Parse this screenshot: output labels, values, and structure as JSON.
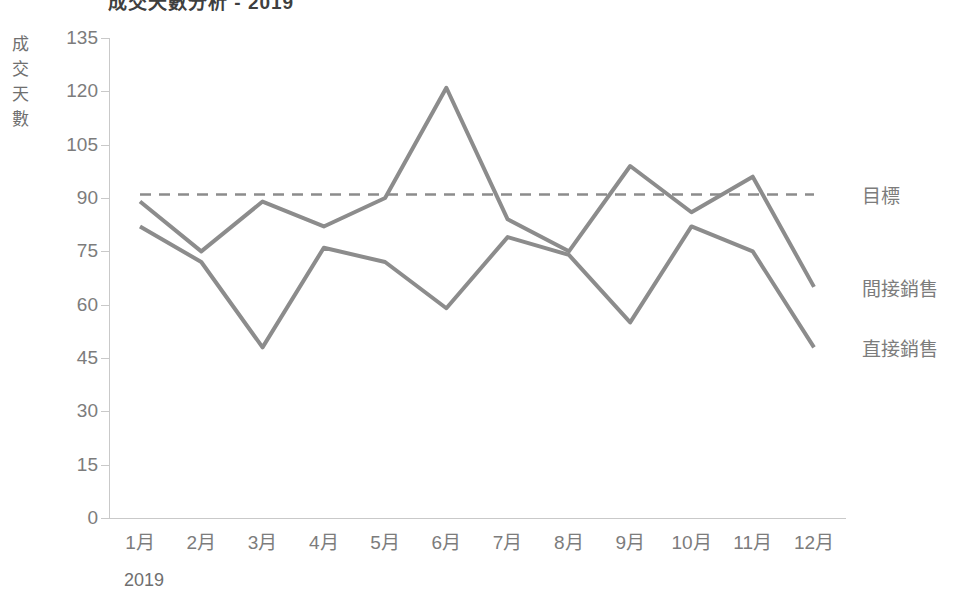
{
  "title": "成交天數分析 - 2019",
  "axes": {
    "y_title": "成交天數",
    "y_title_chars": [
      "成",
      "交",
      "天",
      "數"
    ],
    "x_title": "2019"
  },
  "chart_data": {
    "type": "line",
    "title": "成交天數分析 - 2019",
    "xlabel": "2019",
    "ylabel": "成交天數",
    "categories": [
      "1月",
      "2月",
      "3月",
      "4月",
      "5月",
      "6月",
      "7月",
      "8月",
      "9月",
      "10月",
      "11月",
      "12月"
    ],
    "ylim": [
      0,
      135
    ],
    "yticks": [
      0,
      15,
      30,
      45,
      60,
      75,
      90,
      105,
      120,
      135
    ],
    "ytick_labels": [
      "0",
      "15",
      "30",
      "45",
      "60",
      "75",
      "90",
      "105",
      "120",
      "135"
    ],
    "grid": false,
    "legend_position": "right-inline",
    "series": [
      {
        "name": "間接銷售",
        "style": "solid",
        "color": "#8c8c8c",
        "values": [
          89,
          75,
          89,
          82,
          90,
          121,
          84,
          75,
          99,
          86,
          96,
          65
        ]
      },
      {
        "name": "直接銷售",
        "style": "solid",
        "color": "#8c8c8c",
        "values": [
          82,
          72,
          48,
          76,
          72,
          59,
          79,
          74,
          55,
          82,
          75,
          48
        ]
      },
      {
        "name": "目標",
        "style": "dashed",
        "color": "#8c8c8c",
        "values": [
          91,
          91,
          91,
          91,
          91,
          91,
          91,
          91,
          91,
          91,
          91,
          91
        ]
      }
    ]
  },
  "colors": {
    "line": "#8c8c8c",
    "axis": "#c9c9c9",
    "text": "#7c7c7c"
  }
}
